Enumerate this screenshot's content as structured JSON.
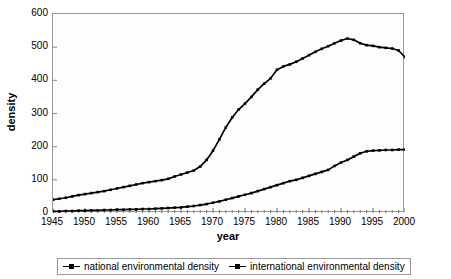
{
  "chart_data": {
    "type": "line",
    "title": "",
    "xlabel": "year",
    "ylabel": "density",
    "xlim": [
      1945,
      2000
    ],
    "ylim": [
      0,
      600
    ],
    "ytick_labels": [
      "600",
      "500",
      "400",
      "300",
      "200",
      "100",
      "0"
    ],
    "ytick_values": [
      600,
      500,
      400,
      300,
      200,
      100,
      0
    ],
    "xtick_labels": [
      "1945",
      "1950",
      "1955",
      "1960",
      "1965",
      "1970",
      "1975",
      "1980",
      "1985",
      "1990",
      "1995",
      "2000"
    ],
    "xtick_values": [
      1945,
      1950,
      1955,
      1960,
      1965,
      1970,
      1975,
      1980,
      1985,
      1990,
      1995,
      2000
    ],
    "minor_xticks_every": 1,
    "grid": false,
    "legend_position": "bottom",
    "x": [
      1945,
      1946,
      1947,
      1948,
      1949,
      1950,
      1951,
      1952,
      1953,
      1954,
      1955,
      1956,
      1957,
      1958,
      1959,
      1960,
      1961,
      1962,
      1963,
      1964,
      1965,
      1966,
      1967,
      1968,
      1969,
      1970,
      1971,
      1972,
      1973,
      1974,
      1975,
      1976,
      1977,
      1978,
      1979,
      1980,
      1981,
      1982,
      1983,
      1984,
      1985,
      1986,
      1987,
      1988,
      1989,
      1990,
      1991,
      1992,
      1993,
      1994,
      1995,
      1996,
      1997,
      1998,
      1999,
      2000
    ],
    "series": [
      {
        "name": "national environmental density",
        "color": "#000000",
        "marker": "square",
        "values": [
          40,
          43,
          46,
          50,
          54,
          57,
          60,
          63,
          66,
          70,
          74,
          78,
          82,
          86,
          90,
          93,
          96,
          99,
          103,
          110,
          116,
          122,
          128,
          140,
          160,
          188,
          222,
          258,
          288,
          312,
          330,
          350,
          372,
          390,
          406,
          432,
          442,
          448,
          456,
          466,
          476,
          486,
          495,
          503,
          512,
          520,
          526,
          522,
          512,
          506,
          504,
          500,
          498,
          496,
          490,
          470
        ]
      },
      {
        "name": "international environmental density",
        "color": "#000000",
        "marker": "square",
        "values": [
          5,
          5,
          6,
          6,
          7,
          7,
          8,
          8,
          9,
          9,
          10,
          10,
          11,
          11,
          12,
          12,
          13,
          14,
          15,
          16,
          17,
          19,
          21,
          24,
          27,
          31,
          35,
          40,
          45,
          50,
          55,
          60,
          66,
          72,
          78,
          84,
          90,
          96,
          100,
          106,
          112,
          118,
          124,
          130,
          142,
          152,
          160,
          170,
          180,
          186,
          188,
          189,
          190,
          190,
          191,
          191
        ]
      }
    ]
  },
  "axes": {
    "y_title": "density",
    "x_title": "year"
  },
  "legend": {
    "items": [
      {
        "label": "national environmental density"
      },
      {
        "label": "international environmental density"
      }
    ]
  }
}
